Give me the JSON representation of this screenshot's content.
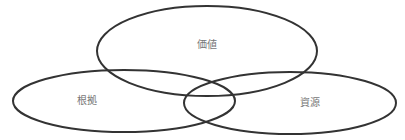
{
  "diagram": {
    "type": "venn",
    "stroke_color": "#333333",
    "label_color": "#777777",
    "background": "#ffffff",
    "sets": [
      {
        "id": "value",
        "label": "価値",
        "cx": 207,
        "cy": 51,
        "rx": 110,
        "ry": 45,
        "label_x": 207,
        "label_y": 48
      },
      {
        "id": "basis",
        "label": "根拠",
        "cx": 124,
        "cy": 101,
        "rx": 111,
        "ry": 31,
        "label_x": 87,
        "label_y": 104
      },
      {
        "id": "resources",
        "label": "資源",
        "cx": 290,
        "cy": 103,
        "rx": 106,
        "ry": 31,
        "label_x": 310,
        "label_y": 106
      }
    ]
  }
}
